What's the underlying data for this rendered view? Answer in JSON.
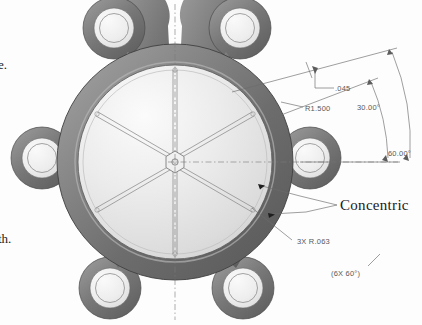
{
  "figure": {
    "kind": "cad-shaded-isometric-hub",
    "canvas": {
      "width": 422,
      "height": 325
    }
  },
  "colors": {
    "background": "#fdfdfd",
    "rim_dark": "#6e6e6e",
    "rim_darker": "#4f4f4f",
    "rim_light": "#9a9a9a",
    "disc_light": "#e7e7e7",
    "disc_lighter": "#f6f6f6",
    "boss_ring": "#ededed",
    "outline": "#4a4a4a",
    "dimension_line": "#6a6a6a",
    "dimension_text": "#595959",
    "note_text": "#1a1a1a"
  },
  "annotations": {
    "radius_fillet": ".045",
    "radius_major": "R1.500",
    "angle_half": "30.00°",
    "angle_full": "60.00°",
    "radius_small": "3X R.063",
    "pattern_note": "(6X 60°)",
    "concentric_note": "Concentric"
  },
  "page_text_fragments": {
    "top": "e.",
    "bottom": "th."
  },
  "geometry": {
    "center": {
      "x": 175,
      "y": 162
    },
    "spoke_count": 6,
    "boss_count": 6,
    "spoke_angle_step_deg": 60,
    "disc_radius": 96,
    "rim_outer_radius": 118,
    "boss_radius": 30,
    "boss_ring_outer_radius": 20,
    "boss_ring_inner_radius": 14,
    "boss_orbit_radius": 132
  }
}
